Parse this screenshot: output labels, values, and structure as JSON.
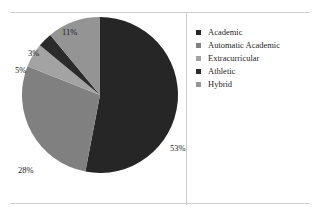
{
  "chart_data": {
    "type": "pie",
    "title": "",
    "categories": [
      "Academic",
      "Automatic Academic",
      "Extracurricular",
      "Athletic",
      "Hybrid"
    ],
    "values": [
      53,
      28,
      5,
      3,
      11
    ],
    "value_labels": [
      "53%",
      "28%",
      "5%",
      "3%",
      "11%"
    ],
    "colors": [
      "#262626",
      "#808080",
      "#a3a3a3",
      "#2b2b2b",
      "#949494"
    ],
    "legend_position": "right",
    "grid": false,
    "start_angle_deg": 0,
    "direction": "clockwise",
    "labels_outside": true
  },
  "legend": {
    "items": [
      {
        "label": "Academic",
        "color": "#262626"
      },
      {
        "label": "Automatic Academic",
        "color": "#808080"
      },
      {
        "label": "Extracurricular",
        "color": "#a3a3a3"
      },
      {
        "label": "Athletic",
        "color": "#2b2b2b"
      },
      {
        "label": "Hybrid",
        "color": "#949494"
      }
    ]
  },
  "labels": {
    "academic": "53%",
    "automatic_academic": "28%",
    "extracurricular": "5%",
    "athletic": "3%",
    "hybrid": "11%"
  }
}
